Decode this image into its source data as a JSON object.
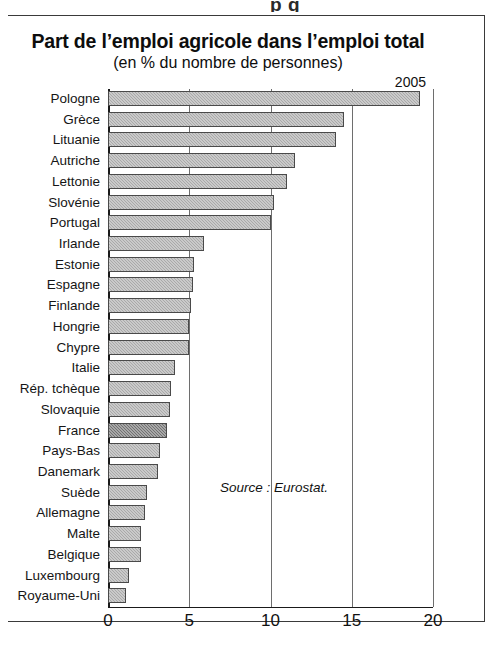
{
  "page": {
    "top_bleed_text": "p    g"
  },
  "chart_data": {
    "type": "bar",
    "orientation": "horizontal",
    "title": "Part de l’emploi agricole dans l’emploi total",
    "subtitle": "(en % du nombre de personnes)",
    "year_label": "2005",
    "source": "Source : Eurostat.",
    "xlabel": "",
    "ylabel": "",
    "xlim": [
      0,
      20
    ],
    "ticks": [
      0,
      5,
      10,
      15,
      20
    ],
    "tick_labels": [
      "0",
      "5",
      "10",
      "15",
      "20"
    ],
    "grid": true,
    "grid_axis": "x",
    "legend": "none",
    "highlight_category": "France",
    "bar_color": "#a9a9a9",
    "highlight_color": "#717171",
    "bar_border_color": "#4a4a4a",
    "categories": [
      "Pologne",
      "Grèce",
      "Lituanie",
      "Autriche",
      "Lettonie",
      "Slovénie",
      "Portugal",
      "Irlande",
      "Estonie",
      "Espagne",
      "Finlande",
      "Hongrie",
      "Chypre",
      "Italie",
      "Rép. tchèque",
      "Slovaquie",
      "France",
      "Pays-Bas",
      "Danemark",
      "Suède",
      "Allemagne",
      "Malte",
      "Belgique",
      "Luxembourg",
      "Royaume-Uni"
    ],
    "values": [
      19.2,
      14.5,
      14.0,
      11.5,
      11.0,
      10.2,
      10.0,
      5.9,
      5.3,
      5.2,
      5.1,
      5.0,
      5.0,
      4.1,
      3.9,
      3.8,
      3.6,
      3.2,
      3.1,
      2.4,
      2.3,
      2.0,
      2.0,
      1.3,
      1.1
    ]
  }
}
